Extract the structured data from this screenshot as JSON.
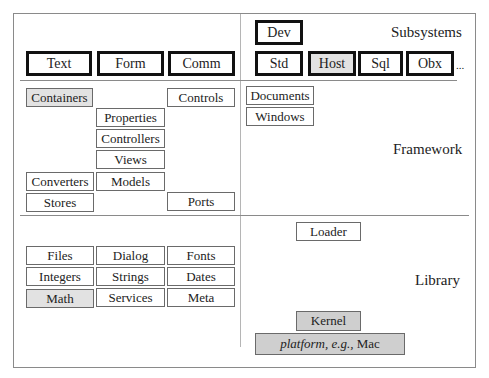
{
  "layers": {
    "subsystems": {
      "label": "Subsystems",
      "left_modules": [
        "Text",
        "Form",
        "Comm"
      ],
      "top_module": "Dev",
      "right_modules": [
        "Std",
        "Host",
        "Sql",
        "Obx"
      ],
      "more": "..."
    },
    "framework": {
      "label": "Framework",
      "modules": {
        "containers": "Containers",
        "controls": "Controls",
        "properties": "Properties",
        "controllers": "Controllers",
        "views": "Views",
        "models": "Models",
        "converters": "Converters",
        "stores": "Stores",
        "ports": "Ports",
        "documents": "Documents",
        "windows": "Windows"
      }
    },
    "library": {
      "label": "Library",
      "grid": [
        [
          "Files",
          "Dialog",
          "Fonts"
        ],
        [
          "Integers",
          "Strings",
          "Dates"
        ],
        [
          "Math",
          "Services",
          "Meta"
        ]
      ],
      "loader": "Loader",
      "kernel": "Kernel",
      "platform_prefix": "platform, e.g.,",
      "platform_name": "Mac"
    }
  },
  "colors": {
    "highlight_light": "#e2e2e2",
    "highlight_dark": "#cfcfcf",
    "border": "#6a6a6a",
    "thick_border": "#111111"
  }
}
